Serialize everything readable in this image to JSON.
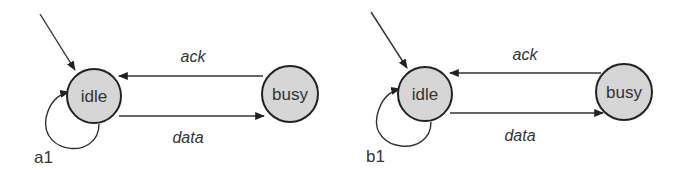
{
  "diagrams": [
    {
      "caption": "a1",
      "states": [
        {
          "name": "idle",
          "initial": true
        },
        {
          "name": "busy"
        }
      ],
      "transitions": [
        {
          "from": "busy",
          "to": "idle",
          "label": "ack"
        },
        {
          "from": "idle",
          "to": "busy",
          "label": "data"
        },
        {
          "from": "idle",
          "to": "idle",
          "label": ""
        }
      ]
    },
    {
      "caption": "b1",
      "states": [
        {
          "name": "idle",
          "initial": true
        },
        {
          "name": "busy"
        }
      ],
      "transitions": [
        {
          "from": "busy",
          "to": "idle",
          "label": "ack"
        },
        {
          "from": "idle",
          "to": "busy",
          "label": "data"
        },
        {
          "from": "idle",
          "to": "idle",
          "label": ""
        }
      ]
    }
  ],
  "colors": {
    "state_fill": "#d6d6d6",
    "stroke": "#222222"
  }
}
